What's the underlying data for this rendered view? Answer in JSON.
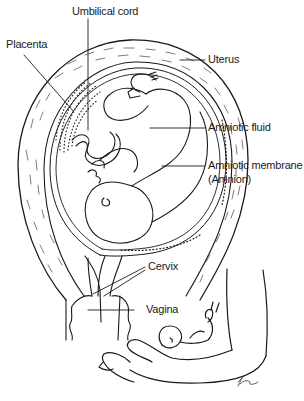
{
  "diagram": {
    "type": "anatomical-illustration",
    "labels": {
      "umbilical_cord": "Umbilical cord",
      "placenta": "Placenta",
      "uterus": "Uterus",
      "amniotic_fluid": "Amniotic fluid",
      "amniotic_membrane": "Amniotic membrane",
      "amnion": "(Amnion)",
      "cervix": "Cervix",
      "vagina": "Vagina"
    },
    "signature": "KW",
    "colors": {
      "ink": "#1a1a1a",
      "background": "#ffffff"
    }
  }
}
